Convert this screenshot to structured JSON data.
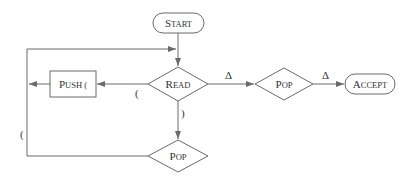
{
  "diagram": {
    "type": "flowchart",
    "colors": {
      "stroke": "#6b6b6b",
      "text": "#333333",
      "background": "#ffffff"
    },
    "nodes": {
      "start": {
        "first": "S",
        "rest": "TART",
        "shape": "terminal"
      },
      "read": {
        "first": "R",
        "rest": "EAD",
        "shape": "decision"
      },
      "push": {
        "first": "P",
        "rest": "USH (",
        "shape": "process"
      },
      "pop_right": {
        "first": "P",
        "rest": "OP",
        "shape": "decision"
      },
      "pop_bottom": {
        "first": "P",
        "rest": "OP",
        "shape": "decision"
      },
      "accept": {
        "first": "A",
        "rest": "CCEPT",
        "shape": "terminal"
      }
    },
    "edges": [
      {
        "from": "start",
        "to": "read",
        "label": ""
      },
      {
        "from": "read",
        "to": "push",
        "label": "("
      },
      {
        "from": "push",
        "to": "loop-left",
        "label": ""
      },
      {
        "from": "read",
        "to": "pop_right",
        "label": "Δ"
      },
      {
        "from": "pop_right",
        "to": "accept",
        "label": "Δ"
      },
      {
        "from": "read",
        "to": "pop_bottom",
        "label": ")"
      },
      {
        "from": "pop_bottom",
        "to": "read",
        "label": "("
      }
    ],
    "edge_labels": {
      "read_push": "(",
      "read_pop": ")",
      "read_popright": "Δ",
      "popright_accept": "Δ",
      "loop_back": "("
    }
  }
}
